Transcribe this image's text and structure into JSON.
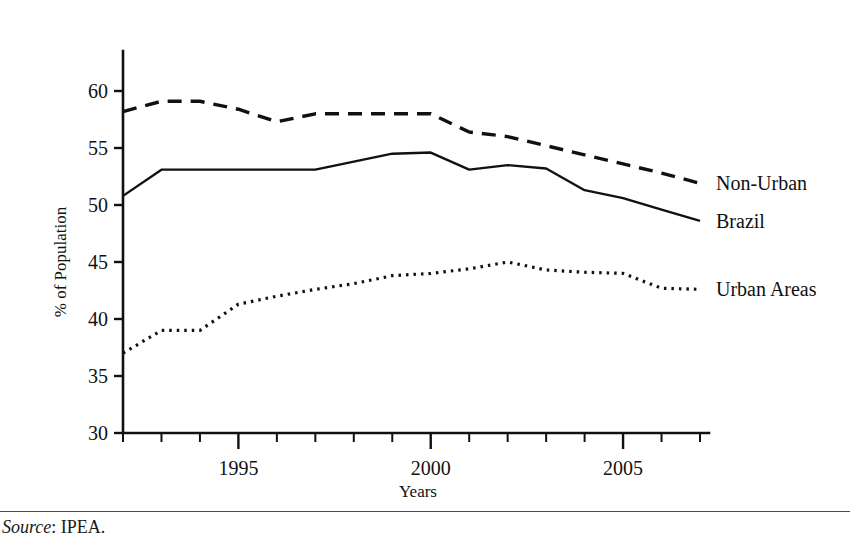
{
  "figure": {
    "source_prefix": "Source",
    "source_separator": ": ",
    "source_value": "IPEA."
  },
  "chart_data": {
    "type": "line",
    "title": "",
    "xlabel": "Years",
    "ylabel": "% of Population",
    "xlim": [
      1992,
      2007
    ],
    "ylim": [
      30,
      60
    ],
    "y_axis_top": 63.5,
    "grid": false,
    "legend_position": "right-inline",
    "x_tick_values": [
      1992,
      1993,
      1994,
      1995,
      1996,
      1997,
      1998,
      1999,
      2000,
      2001,
      2002,
      2003,
      2004,
      2005,
      2006,
      2007
    ],
    "x_tick_labels": [
      "",
      "",
      "",
      "1995",
      "",
      "",
      "",
      "",
      "2000",
      "",
      "",
      "",
      "",
      "2005",
      "",
      ""
    ],
    "y_tick_values": [
      30,
      35,
      40,
      45,
      50,
      55,
      60
    ],
    "y_tick_labels": [
      "30",
      "35",
      "40",
      "45",
      "50",
      "55",
      "60"
    ],
    "x": [
      1992,
      1993,
      1994,
      1995,
      1996,
      1997,
      1998,
      1999,
      2000,
      2001,
      2002,
      2003,
      2004,
      2005,
      2006,
      2007
    ],
    "series": [
      {
        "name": "Non-Urban",
        "label": "Non-Urban",
        "style": "dashed",
        "dash_pattern": "14,9",
        "stroke_width": 3.4,
        "color": "#111111",
        "values": [
          58.2,
          59.1,
          59.1,
          58.4,
          57.3,
          58.0,
          58.0,
          58.0,
          58.0,
          56.4,
          56.0,
          55.2,
          54.4,
          53.6,
          52.8,
          51.9
        ]
      },
      {
        "name": "Brazil",
        "label": "Brazil",
        "style": "solid",
        "dash_pattern": "",
        "stroke_width": 2.4,
        "color": "#111111",
        "values": [
          50.8,
          53.1,
          53.1,
          53.1,
          53.1,
          53.1,
          53.8,
          54.5,
          54.6,
          53.1,
          53.5,
          53.2,
          51.3,
          50.6,
          49.6,
          48.6
        ]
      },
      {
        "name": "Urban Areas",
        "label": "Urban Areas",
        "style": "dotted",
        "dash_pattern": "2.5,5",
        "stroke_width": 3.2,
        "color": "#111111",
        "values": [
          37.0,
          39.0,
          39.0,
          41.3,
          42.0,
          42.6,
          43.1,
          43.8,
          44.0,
          44.4,
          45.0,
          44.3,
          44.1,
          44.0,
          42.7,
          42.6
        ]
      }
    ]
  }
}
